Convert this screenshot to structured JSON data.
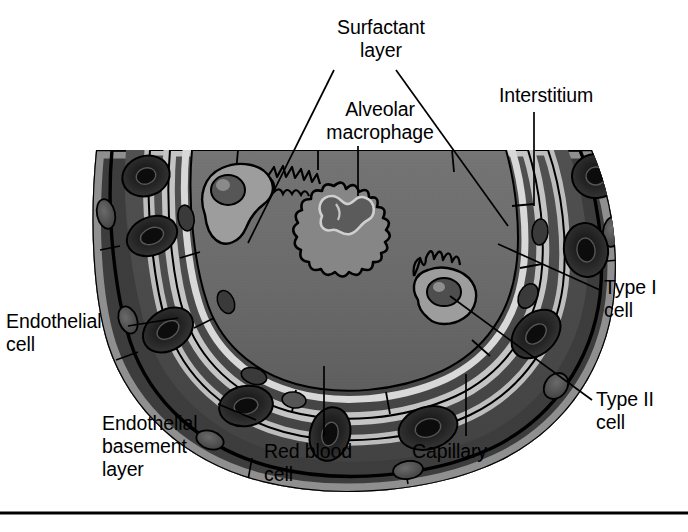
{
  "figure": {
    "caption_rule": true
  },
  "labels": {
    "surfactant_layer": "Surfactant\nlayer",
    "alveolar_macrophage": "Alveolar\nmacrophage",
    "interstitium": "Interstitium",
    "type_i_cell": "Type I\ncell",
    "type_ii_cell": "Type II\ncell",
    "endothelial_cell": "Endothelial\ncell",
    "endothelial_basement_layer": "Endothelial\nbasement\nlayer",
    "red_blood_cell": "Red blood\ncell",
    "capillary": "Capillary"
  },
  "colors": {
    "background": "#ffffff",
    "alveolar_space": "#6e6e6e",
    "alveolar_space_dark": "#5e5e5e",
    "surfactant": "#c9c9c9",
    "epithelium": "#9a9a9a",
    "basement_membrane": "#b8b8b8",
    "interstitium": "#4a4a4a",
    "capillary_lumen": "#3c3c3c",
    "endothelium": "#8d8d8d",
    "red_blood_cell": "#2a2a2a",
    "red_blood_cell_core": "#141414",
    "nucleus": "#4e4e4e",
    "macrophage_body": "#808080",
    "macrophage_nucleus": "#5a5a5a",
    "outline": "#000000",
    "leader_line": "#000000",
    "text": "#000000"
  },
  "structures": [
    {
      "name": "alveolar-space",
      "description": "Central air space of the alveolus"
    },
    {
      "name": "surfactant-layer",
      "description": "Thin pale film lining the alveolar surface"
    },
    {
      "name": "type-i-cell",
      "description": "Flat squamous epithelial cell lining the alveolus"
    },
    {
      "name": "type-ii-cell",
      "description": "Cuboidal surfactant-producing cell with microvilli"
    },
    {
      "name": "alveolar-macrophage",
      "description": "Free ruffled phagocytic cell in the alveolar space"
    },
    {
      "name": "interstitium",
      "description": "Connective-tissue space between epithelium and endothelium"
    },
    {
      "name": "endothelial-basement-layer",
      "description": "Basement membrane beneath the endothelium"
    },
    {
      "name": "endothelial-cell",
      "description": "Flat cell forming the capillary wall"
    },
    {
      "name": "capillary",
      "description": "Blood vessel lumen adjacent to the alveolus"
    },
    {
      "name": "red-blood-cell",
      "description": "Biconcave erythrocyte within the capillary"
    }
  ],
  "leaders": [
    {
      "name": "surfactant-left",
      "from_label": "surfactant_layer",
      "to_structure": "surfactant-layer"
    },
    {
      "name": "surfactant-right",
      "from_label": "surfactant_layer",
      "to_structure": "surfactant-layer"
    },
    {
      "name": "macrophage",
      "from_label": "alveolar_macrophage",
      "to_structure": "alveolar-macrophage"
    },
    {
      "name": "interstitium",
      "from_label": "interstitium",
      "to_structure": "interstitium"
    },
    {
      "name": "type-i",
      "from_label": "type_i_cell",
      "to_structure": "type-i-cell"
    },
    {
      "name": "type-ii",
      "from_label": "type_ii_cell",
      "to_structure": "type-ii-cell"
    },
    {
      "name": "endothelial",
      "from_label": "endothelial_cell",
      "to_structure": "endothelial-cell"
    },
    {
      "name": "basement",
      "from_label": "endothelial_basement_layer",
      "to_structure": "endothelial-basement-layer"
    },
    {
      "name": "red-blood",
      "from_label": "red_blood_cell",
      "to_structure": "red-blood-cell"
    },
    {
      "name": "capillary",
      "from_label": "capillary",
      "to_structure": "capillary"
    }
  ]
}
